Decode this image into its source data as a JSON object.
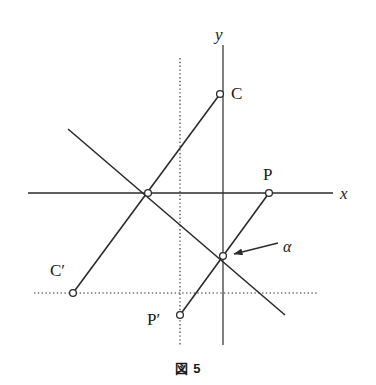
{
  "figure": {
    "caption": "図 5",
    "caption_number": "5",
    "stroke_color": "#2b2b2b",
    "background_color": "#ffffff"
  },
  "axes": {
    "x_label": "x",
    "y_label": "y",
    "x_axis": {
      "x1": 28,
      "y1": 193,
      "x2": 333,
      "y2": 193
    },
    "y_axis": {
      "x1": 223,
      "y1": 45,
      "x2": 223,
      "y2": 345
    },
    "x_label_pos": {
      "x": 340,
      "y": 185
    },
    "y_label_pos": {
      "x": 215,
      "y": 26
    }
  },
  "guides": {
    "vertical_dotted": {
      "x1": 180,
      "y1": 58,
      "x2": 180,
      "y2": 345
    },
    "horizontal_dotted": {
      "x1": 34,
      "y1": 293,
      "x2": 318,
      "y2": 293
    }
  },
  "lines": [
    {
      "name": "line-C-to-Cprime",
      "x1": 220,
      "y1": 94,
      "x2": 73,
      "y2": 293
    },
    {
      "name": "line-descending",
      "x1": 68,
      "y1": 129,
      "x2": 285,
      "y2": 315
    },
    {
      "name": "line-P-to-Pprime",
      "x1": 269,
      "y1": 193,
      "x2": 180,
      "y2": 315
    }
  ],
  "points": [
    {
      "name": "point-C",
      "label": "C",
      "cx": 220,
      "cy": 94,
      "label_x": 231,
      "label_y": 85
    },
    {
      "name": "point-P",
      "label": "P",
      "cx": 269,
      "cy": 193,
      "label_x": 263,
      "label_y": 166
    },
    {
      "name": "point-Cprime",
      "label": "C′",
      "cx": 73,
      "cy": 293,
      "label_x": 50,
      "label_y": 262
    },
    {
      "name": "point-Pprime",
      "label": "P′",
      "cx": 180,
      "cy": 315,
      "label_x": 147,
      "label_y": 311
    },
    {
      "name": "point-alpha",
      "label": "",
      "cx": 223,
      "cy": 256,
      "label_x": 0,
      "label_y": 0
    },
    {
      "name": "point-intersection-x-axis",
      "label": "",
      "cx": 148,
      "cy": 193,
      "label_x": 0,
      "label_y": 0
    }
  ],
  "annotation": {
    "alpha_label": "α",
    "alpha_label_pos": {
      "x": 283,
      "y": 239
    },
    "arrow_tail": {
      "x": 278,
      "y": 243
    },
    "arrow_head": {
      "x": 234,
      "y": 254
    }
  }
}
